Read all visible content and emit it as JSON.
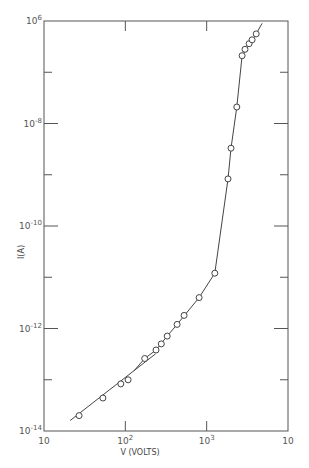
{
  "chart_data": {
    "type": "scatter",
    "title": "",
    "xlabel": "V (VOLTS)",
    "ylabel": "I(A)",
    "xscale": "log",
    "yscale": "log",
    "xlim": [
      10,
      10000
    ],
    "ylim": [
      1e-14,
      1e-06
    ],
    "grid": false,
    "x_tick_labels": [
      {
        "value": 10,
        "base": "10",
        "exp": ""
      },
      {
        "value": 100,
        "base": "10",
        "exp": "2"
      },
      {
        "value": 1000,
        "base": "10",
        "exp": "3"
      },
      {
        "value": 10000,
        "base": "10",
        "exp": ""
      }
    ],
    "y_tick_labels": [
      {
        "value": 1e-06,
        "base": "10",
        "exp": "6"
      },
      {
        "value": 1e-08,
        "base": "10",
        "exp": "-8"
      },
      {
        "value": 1e-10,
        "base": "10",
        "exp": "-10"
      },
      {
        "value": 1e-12,
        "base": "10",
        "exp": "-12"
      },
      {
        "value": 1e-14,
        "base": "10",
        "exp": "-14"
      }
    ],
    "y_minor_ticks": [
      1e-07,
      1e-09,
      1e-11,
      1e-13
    ],
    "series": [
      {
        "name": "measured",
        "marker": "open-circle",
        "points": [
          [
            27,
            2e-14
          ],
          [
            53,
            4.4e-14
          ],
          [
            88,
            8.3e-14
          ],
          [
            108,
            1e-13
          ],
          [
            173,
            2.6e-13
          ],
          [
            238,
            3.8e-13
          ],
          [
            277,
            5e-13
          ],
          [
            327,
            7.1e-13
          ],
          [
            433,
            1.2e-12
          ],
          [
            528,
            1.8e-12
          ],
          [
            808,
            4e-12
          ],
          [
            1260,
            1.2e-11
          ],
          [
            1830,
            8.3e-10
          ],
          [
            1990,
            3.3e-09
          ],
          [
            2350,
            2.1e-08
          ],
          [
            2730,
            2.1e-07
          ],
          [
            2960,
            2.8e-07
          ],
          [
            3320,
            3.6e-07
          ],
          [
            3620,
            4.3e-07
          ],
          [
            4060,
            5.6e-07
          ]
        ]
      }
    ],
    "lines": [
      {
        "name": "ohmic-fit-line",
        "points": [
          [
            21,
            1.6e-14
          ],
          [
            235,
            3.2e-13
          ]
        ]
      },
      {
        "name": "main-curve",
        "points": [
          [
            128,
            1.5e-13
          ],
          [
            173,
            2.6e-13
          ],
          [
            238,
            3.8e-13
          ],
          [
            327,
            7.1e-13
          ],
          [
            433,
            1.2e-12
          ],
          [
            808,
            4e-12
          ],
          [
            1260,
            1.2e-11
          ],
          [
            1830,
            8.3e-10
          ],
          [
            1990,
            3.3e-09
          ],
          [
            2350,
            2.1e-08
          ],
          [
            2730,
            2.1e-07
          ],
          [
            4060,
            5.6e-07
          ],
          [
            4800,
            9e-07
          ]
        ]
      }
    ]
  }
}
